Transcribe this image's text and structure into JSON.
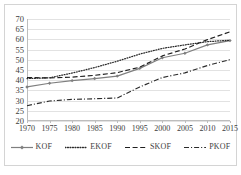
{
  "chart_data": {
    "type": "line",
    "title": "",
    "subtitle": "",
    "xlabel": "",
    "ylabel": "",
    "x": [
      1970,
      1975,
      1980,
      1985,
      1990,
      1995,
      2000,
      2005,
      2010,
      2015
    ],
    "xticklabels": [
      "1970",
      "1975",
      "1980",
      "1985",
      "1990",
      "1995",
      "2000",
      "2005",
      "2010",
      "2015"
    ],
    "yticklabels": [
      "20",
      "25",
      "30",
      "35",
      "40",
      "45",
      "50",
      "55",
      "60",
      "65",
      "70"
    ],
    "yticks": [
      20,
      25,
      30,
      35,
      40,
      45,
      50,
      55,
      60,
      65,
      70
    ],
    "xlim": [
      1970,
      2015
    ],
    "ylim": [
      20,
      70
    ],
    "grid": "horizontal",
    "legend_position": "bottom",
    "series": [
      {
        "name": "KOF",
        "style": "solid-markers",
        "color": "#7f7f7f",
        "marker": "diamond",
        "values": [
          36.7,
          38.5,
          39.8,
          40.8,
          42.0,
          45.8,
          51.0,
          53.2,
          57.3,
          59.4
        ]
      },
      {
        "name": "EKOF",
        "style": "dotted",
        "color": "#2b2b2b",
        "marker": "none",
        "values": [
          40.8,
          41.2,
          43.5,
          46.2,
          49.3,
          52.8,
          55.6,
          57.3,
          58.9,
          59.6
        ]
      },
      {
        "name": "SKOF",
        "style": "dashed",
        "color": "#1f1f1f",
        "marker": "none",
        "values": [
          41.3,
          41.1,
          41.5,
          42.4,
          43.7,
          46.4,
          51.9,
          55.3,
          59.9,
          63.7
        ]
      },
      {
        "name": "PKOF",
        "style": "dash-dot",
        "color": "#2b2b2b",
        "marker": "none",
        "values": [
          27.5,
          29.8,
          30.6,
          30.9,
          31.3,
          36.7,
          41.3,
          43.6,
          47.2,
          50.1
        ]
      }
    ]
  },
  "legend": {
    "items": [
      {
        "label": "KOF"
      },
      {
        "label": "EKOF"
      },
      {
        "label": "SKOF"
      },
      {
        "label": "PKOF"
      }
    ]
  }
}
